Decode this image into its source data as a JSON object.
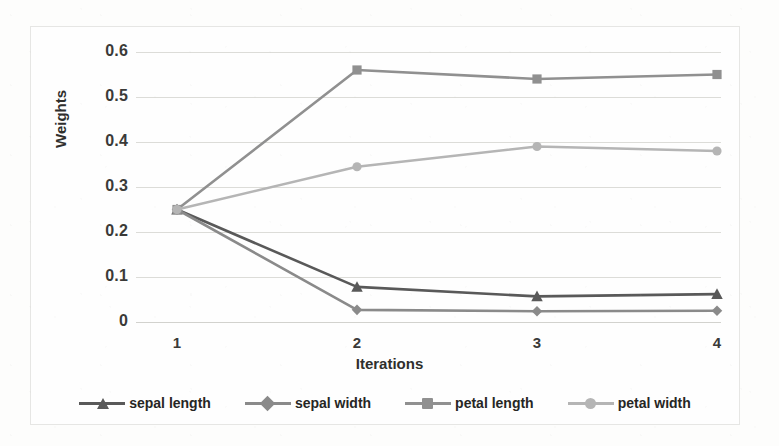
{
  "chart_data": {
    "type": "line",
    "title": "",
    "xlabel": "Iterations",
    "ylabel": "Weights",
    "x": [
      1,
      2,
      3,
      4
    ],
    "xtick_labels": [
      "1",
      "2",
      "3",
      "4"
    ],
    "ytick_labels": [
      "0",
      "0.1",
      "0.2",
      "0.3",
      "0.4",
      "0.5",
      "0.6"
    ],
    "ytick_values": [
      0,
      0.1,
      0.2,
      0.3,
      0.4,
      0.5,
      0.6
    ],
    "ylim": [
      0,
      0.6
    ],
    "xlim": [
      1,
      4
    ],
    "grid": "horizontal",
    "legend_position": "bottom",
    "series": [
      {
        "name": "sepal length",
        "marker": "triangle",
        "color": "#595959",
        "values": [
          0.25,
          0.078,
          0.057,
          0.062
        ]
      },
      {
        "name": "sepal width",
        "marker": "diamond",
        "color": "#8a8a8a",
        "values": [
          0.25,
          0.027,
          0.024,
          0.025
        ]
      },
      {
        "name": "petal length",
        "marker": "square",
        "color": "#909090",
        "values": [
          0.25,
          0.56,
          0.54,
          0.55
        ]
      },
      {
        "name": "petal width",
        "marker": "circle",
        "color": "#b5b5b5",
        "values": [
          0.25,
          0.345,
          0.39,
          0.38
        ]
      }
    ]
  },
  "colors": {
    "gridline": "#dcdcd8",
    "axis_text": "#3a3a38",
    "frame": "#e6e6e4",
    "background": "#fefefe"
  }
}
